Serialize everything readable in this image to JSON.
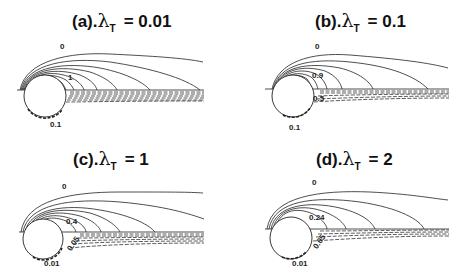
{
  "figure": {
    "panels": [
      {
        "id": "a",
        "prefix": "(a).",
        "symbol": "λ",
        "subscript": "T",
        "equals": "= 0.01",
        "labels": {
          "outer": "0",
          "inner": "1",
          "wake_low": "0.1"
        }
      },
      {
        "id": "b",
        "prefix": "(b).",
        "symbol": "λ",
        "subscript": "T",
        "equals": "= 0.1",
        "labels": {
          "outer": "0",
          "inner": "0.9",
          "mid": "0.5",
          "wake_low": "0.1"
        }
      },
      {
        "id": "c",
        "prefix": "(c).",
        "symbol": "λ",
        "subscript": "T",
        "equals": "= 1",
        "labels": {
          "outer": "0",
          "inner": "0.4",
          "mid": "0.05",
          "wake_low": "0.01"
        }
      },
      {
        "id": "d",
        "prefix": "(d).",
        "symbol": "λ",
        "subscript": "T",
        "equals": "= 2",
        "labels": {
          "outer": "0",
          "inner": "0.24",
          "mid": "0.05",
          "wake_low": "0.01"
        }
      }
    ],
    "line_styles": {
      "above_axis": "solid",
      "below_axis": "dashed"
    },
    "colors": {
      "lines": "#222222",
      "background": "#ffffff"
    }
  }
}
